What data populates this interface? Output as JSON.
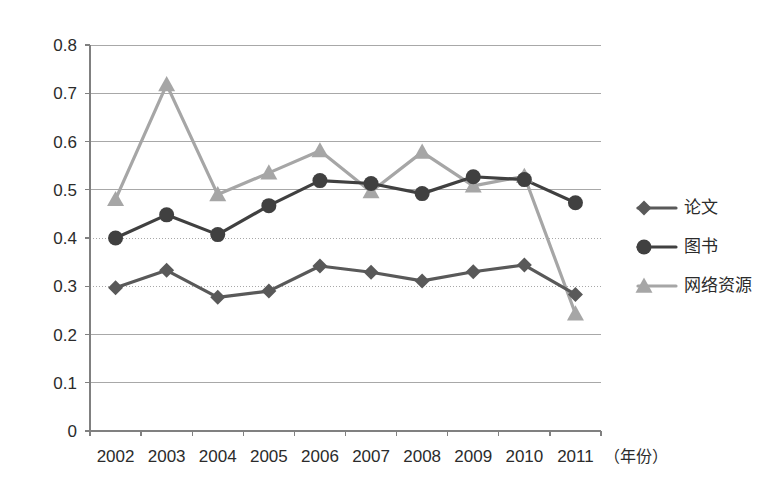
{
  "chart_data": {
    "type": "line",
    "title": "",
    "subtitle": "",
    "xlabel": "（年份）",
    "ylabel": "",
    "categories": [
      "2002",
      "2003",
      "2004",
      "2005",
      "2006",
      "2007",
      "2008",
      "2009",
      "2010",
      "2011"
    ],
    "x": [
      2002,
      2003,
      2004,
      2005,
      2006,
      2007,
      2008,
      2009,
      2010,
      2011
    ],
    "ylim": [
      0,
      0.8
    ],
    "yticks": [
      0,
      0.1,
      0.2,
      0.3,
      0.4,
      0.5,
      0.6,
      0.7,
      0.8
    ],
    "ytick_labels": [
      "0",
      "0.1",
      "0.2",
      "0.3",
      "0.4",
      "0.5",
      "0.6",
      "0.7",
      "0.8"
    ],
    "grid": true,
    "grid_axis": "y",
    "legend_position": "right",
    "series": [
      {
        "name": "论文",
        "marker": "diamond",
        "color": "#595959",
        "values": [
          0.297,
          0.333,
          0.277,
          0.29,
          0.342,
          0.329,
          0.311,
          0.33,
          0.344,
          0.283
        ]
      },
      {
        "name": "图书",
        "marker": "circle",
        "color": "#404040",
        "values": [
          0.4,
          0.448,
          0.407,
          0.467,
          0.519,
          0.513,
          0.492,
          0.527,
          0.521,
          0.473
        ]
      },
      {
        "name": "网络资源",
        "marker": "triangle",
        "color": "#a6a6a6",
        "values": [
          0.48,
          0.718,
          0.49,
          0.535,
          0.581,
          0.496,
          0.578,
          0.508,
          0.528,
          0.243
        ]
      }
    ]
  },
  "legend": {
    "items": [
      {
        "label": "论文",
        "marker": "diamond",
        "color": "#595959"
      },
      {
        "label": "图书",
        "marker": "circle",
        "color": "#404040"
      },
      {
        "label": "网络资源",
        "marker": "triangle",
        "color": "#a6a6a6"
      }
    ]
  },
  "axes": {
    "x_unit_label": "（年份）",
    "axis_color": "#808080",
    "grid_color": "#a8a8a8",
    "background": "#ffffff"
  }
}
